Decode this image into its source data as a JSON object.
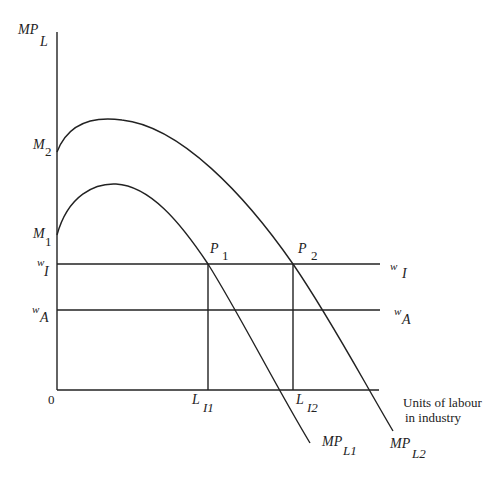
{
  "diagram": {
    "y_axis": {
      "label_main": "MP",
      "label_sub": "L"
    },
    "x_axis": {
      "origin": "0",
      "label_line1": "Units of labour",
      "label_line2": "in industry"
    },
    "intercepts": {
      "m2": {
        "main": "M",
        "sub": "2"
      },
      "m1": {
        "main": "M",
        "sub": "1"
      }
    },
    "wages": {
      "industry": {
        "main": "w",
        "sub": "I"
      },
      "agriculture": {
        "main": "w",
        "sub": "A"
      }
    },
    "points": {
      "p1": {
        "main": "P",
        "sub": "1"
      },
      "p2": {
        "main": "P",
        "sub": "2"
      }
    },
    "labour_levels": {
      "l1": {
        "main": "L",
        "sub": "I1"
      },
      "l2": {
        "main": "L",
        "sub": "I2"
      }
    },
    "curves": {
      "mpl1": {
        "main": "MP",
        "sub": "L1"
      },
      "mpl2": {
        "main": "MP",
        "sub": "L2"
      }
    },
    "colors": {
      "line": "#222222",
      "background": "#ffffff"
    }
  }
}
